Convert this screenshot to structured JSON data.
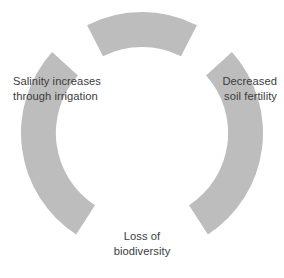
{
  "diagram": {
    "type": "cycle",
    "title": "",
    "arc_color": "#bdbdbd",
    "text_color": "#3c3c3c",
    "background_color": "#ffffff",
    "segments": [
      {
        "id": "arc-top",
        "name": "arc-segment-top",
        "start_angle_deg": -117,
        "end_angle_deg": -63
      },
      {
        "id": "arc-right",
        "name": "arc-segment-right",
        "start_angle_deg": -42,
        "end_angle_deg": 57
      },
      {
        "id": "arc-left",
        "name": "arc-segment-left",
        "start_angle_deg": 123,
        "end_angle_deg": 222
      }
    ],
    "labels": [
      {
        "id": "label-salinity",
        "position": "left",
        "line1": "Salinity increases",
        "line2": "through irrigation"
      },
      {
        "id": "label-soil-fertility",
        "position": "right",
        "line1": "Decreased",
        "line2": "soil fertility"
      },
      {
        "id": "label-biodiversity",
        "position": "bottom",
        "line1": "Loss of",
        "line2": "biodiversity"
      }
    ],
    "geometry": {
      "center_x": 142,
      "center_y": 133,
      "outer_radius": 121,
      "inner_radius": 86
    }
  }
}
